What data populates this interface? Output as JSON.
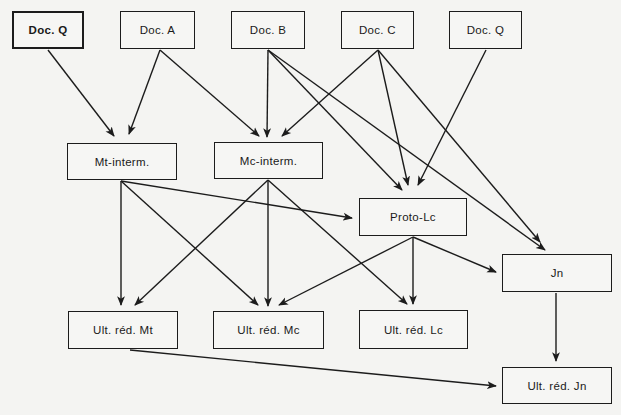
{
  "diagram": {
    "type": "stemma / dependency graph",
    "colors": {
      "background": "#f4f4f2",
      "stroke": "#1c1c1c"
    },
    "nodes": [
      {
        "id": "docQ1",
        "label": "Doc. Q",
        "x": 12,
        "y": 11,
        "w": 72,
        "h": 38,
        "bold": true
      },
      {
        "id": "docA",
        "label": "Doc. A",
        "x": 120,
        "y": 11,
        "w": 75,
        "h": 38
      },
      {
        "id": "docB",
        "label": "Doc. B",
        "x": 231,
        "y": 11,
        "w": 74,
        "h": 38
      },
      {
        "id": "docC",
        "label": "Doc. C",
        "x": 341,
        "y": 11,
        "w": 73,
        "h": 38
      },
      {
        "id": "docQ2",
        "label": "Doc. Q",
        "x": 449,
        "y": 11,
        "w": 73,
        "h": 38
      },
      {
        "id": "mtInterm",
        "label": "Mt-interm.",
        "x": 67,
        "y": 143,
        "w": 110,
        "h": 37
      },
      {
        "id": "mcInterm",
        "label": "Mc-interm.",
        "x": 214,
        "y": 142,
        "w": 109,
        "h": 37
      },
      {
        "id": "protoLc",
        "label": "Proto-Lc",
        "x": 359,
        "y": 198,
        "w": 108,
        "h": 38
      },
      {
        "id": "jn",
        "label": "Jn",
        "x": 502,
        "y": 254,
        "w": 110,
        "h": 38
      },
      {
        "id": "ultMt",
        "label": "Ult. réd. Mt",
        "x": 68,
        "y": 311,
        "w": 110,
        "h": 38
      },
      {
        "id": "ultMc",
        "label": "Ult. réd. Mc",
        "x": 213,
        "y": 311,
        "w": 111,
        "h": 38
      },
      {
        "id": "ultLc",
        "label": "Ult. réd. Lc",
        "x": 359,
        "y": 310,
        "w": 109,
        "h": 39
      },
      {
        "id": "ultJn",
        "label": "Ult. réd. Jn",
        "x": 502,
        "y": 367,
        "w": 110,
        "h": 37
      }
    ],
    "edges": [
      {
        "from": "docQ1",
        "to": "mtInterm",
        "x1": 48,
        "y1": 50,
        "x2": 114,
        "y2": 136
      },
      {
        "from": "docA",
        "to": "mtInterm",
        "x1": 160,
        "y1": 50,
        "x2": 129,
        "y2": 134
      },
      {
        "from": "docA",
        "to": "mcInterm",
        "x1": 160,
        "y1": 50,
        "x2": 259,
        "y2": 136
      },
      {
        "from": "docB",
        "to": "mcInterm",
        "x1": 268,
        "y1": 50,
        "x2": 267,
        "y2": 137
      },
      {
        "from": "docB",
        "to": "protoLc",
        "x1": 268,
        "y1": 50,
        "x2": 402,
        "y2": 190
      },
      {
        "from": "docB",
        "to": "jn",
        "x1": 268,
        "y1": 50,
        "x2": 545,
        "y2": 250
      },
      {
        "from": "docC",
        "to": "mcInterm",
        "x1": 378,
        "y1": 50,
        "x2": 282,
        "y2": 136
      },
      {
        "from": "docC",
        "to": "protoLc",
        "x1": 378,
        "y1": 50,
        "x2": 408,
        "y2": 185
      },
      {
        "from": "docC",
        "to": "jn",
        "x1": 378,
        "y1": 50,
        "x2": 540,
        "y2": 242
      },
      {
        "from": "docQ2",
        "to": "protoLc",
        "x1": 486,
        "y1": 50,
        "x2": 418,
        "y2": 185
      },
      {
        "from": "mtInterm",
        "to": "protoLc",
        "x1": 121,
        "y1": 181,
        "x2": 352,
        "y2": 218
      },
      {
        "from": "mtInterm",
        "to": "ultMt",
        "x1": 121,
        "y1": 181,
        "x2": 121,
        "y2": 305
      },
      {
        "from": "mtInterm",
        "to": "ultMc",
        "x1": 121,
        "y1": 181,
        "x2": 258,
        "y2": 305
      },
      {
        "from": "mcInterm",
        "to": "ultMt",
        "x1": 268,
        "y1": 180,
        "x2": 135,
        "y2": 305
      },
      {
        "from": "mcInterm",
        "to": "ultMc",
        "x1": 268,
        "y1": 180,
        "x2": 268,
        "y2": 306
      },
      {
        "from": "mcInterm",
        "to": "ultLc",
        "x1": 268,
        "y1": 180,
        "x2": 407,
        "y2": 304
      },
      {
        "from": "protoLc",
        "to": "ultMc",
        "x1": 413,
        "y1": 237,
        "x2": 279,
        "y2": 305
      },
      {
        "from": "protoLc",
        "to": "ultLc",
        "x1": 413,
        "y1": 237,
        "x2": 413,
        "y2": 304
      },
      {
        "from": "protoLc",
        "to": "jn",
        "x1": 413,
        "y1": 237,
        "x2": 496,
        "y2": 272
      },
      {
        "from": "jn",
        "to": "ultJn",
        "x1": 556,
        "y1": 293,
        "x2": 556,
        "y2": 361
      },
      {
        "from": "ultMt",
        "to": "ultJn",
        "x1": 130,
        "y1": 350,
        "x2": 496,
        "y2": 386
      }
    ]
  }
}
